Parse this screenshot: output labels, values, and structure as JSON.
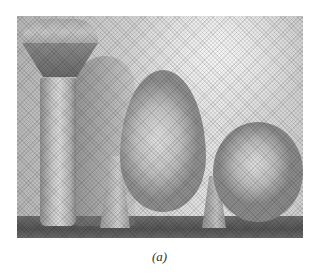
{
  "figure": {
    "caption": "(a)",
    "image": {
      "description": "Grayscale halftone photograph of three objects on a table",
      "objects": [
        "mushroom-shaped peg",
        "egg on a stand",
        "sphere on a stand"
      ]
    }
  }
}
